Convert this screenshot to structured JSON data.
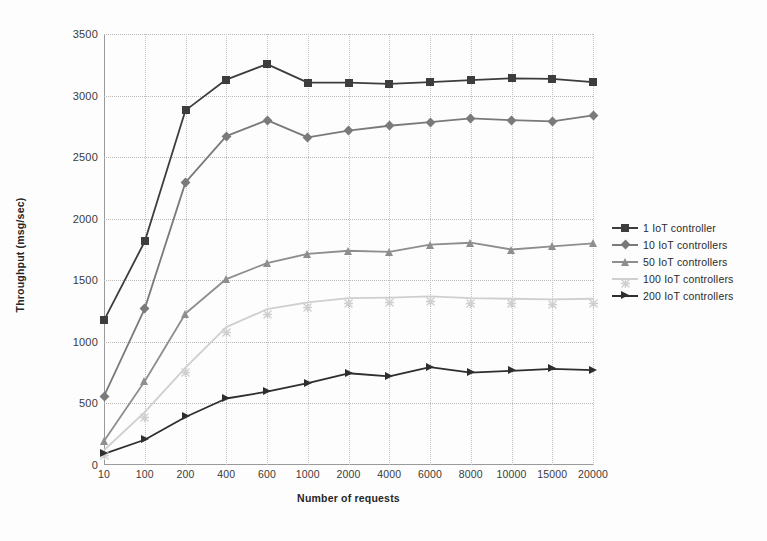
{
  "figure": {
    "background": "#fdfdfd"
  },
  "chart_data": {
    "type": "line",
    "title": "",
    "xlabel": "Number of requests",
    "ylabel": "Throughput (msg/sec)",
    "categories": [
      "10",
      "100",
      "200",
      "400",
      "600",
      "1000",
      "2000",
      "4000",
      "6000",
      "8000",
      "10000",
      "15000",
      "20000"
    ],
    "ylim": [
      0,
      3500
    ],
    "yticks": [
      0,
      500,
      1000,
      1500,
      2000,
      2500,
      3000,
      3500
    ],
    "grid": true,
    "legend_position": "right",
    "series": [
      {
        "name": "1 IoT controller",
        "color": "#3d3d3d",
        "marker": "square",
        "values": [
          1175,
          1815,
          2880,
          3130,
          3255,
          3105,
          3105,
          3095,
          3110,
          3125,
          3140,
          3135,
          3110
        ]
      },
      {
        "name": "10 IoT controllers",
        "color": "#7a7a7a",
        "marker": "diamond",
        "values": [
          560,
          1270,
          2295,
          2670,
          2800,
          2660,
          2715,
          2755,
          2785,
          2815,
          2800,
          2790,
          2840
        ]
      },
      {
        "name": "50 IoT controllers",
        "color": "#8e8e8e",
        "marker": "triangle",
        "values": [
          195,
          680,
          1230,
          1510,
          1640,
          1715,
          1740,
          1730,
          1790,
          1805,
          1750,
          1775,
          1800
        ]
      },
      {
        "name": "100 IoT controllers",
        "color": "#cfcfcf",
        "marker": "x",
        "values": [
          120,
          430,
          790,
          1120,
          1265,
          1320,
          1355,
          1360,
          1370,
          1355,
          1350,
          1345,
          1350
        ]
      },
      {
        "name": "200  IoT controllers",
        "color": "#2e2e2e",
        "marker": "triangle-right",
        "values": [
          90,
          205,
          390,
          540,
          595,
          665,
          745,
          720,
          795,
          750,
          765,
          780,
          770
        ]
      }
    ]
  }
}
